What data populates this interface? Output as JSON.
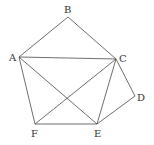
{
  "diagram": {
    "type": "geometry-figure",
    "line_color": "#4a4a4a",
    "label_color": "#333333",
    "vertices": [
      {
        "id": "A",
        "label": "A",
        "x": 19,
        "y": 57,
        "label_x": 9,
        "label_y": 61
      },
      {
        "id": "B",
        "label": "B",
        "x": 68,
        "y": 17,
        "label_x": 64,
        "label_y": 13
      },
      {
        "id": "C",
        "label": "C",
        "x": 116,
        "y": 59,
        "label_x": 119,
        "label_y": 62
      },
      {
        "id": "D",
        "label": "D",
        "x": 135,
        "y": 96,
        "label_x": 137,
        "label_y": 101
      },
      {
        "id": "E",
        "label": "E",
        "x": 97,
        "y": 124,
        "label_x": 94,
        "label_y": 137
      },
      {
        "id": "F",
        "label": "F",
        "x": 35,
        "y": 124,
        "label_x": 31,
        "label_y": 137
      }
    ],
    "edges": [
      [
        "A",
        "B"
      ],
      [
        "B",
        "C"
      ],
      [
        "A",
        "C"
      ],
      [
        "A",
        "F"
      ],
      [
        "A",
        "E"
      ],
      [
        "C",
        "F"
      ],
      [
        "C",
        "E"
      ],
      [
        "C",
        "D"
      ],
      [
        "D",
        "E"
      ],
      [
        "F",
        "E"
      ]
    ]
  }
}
